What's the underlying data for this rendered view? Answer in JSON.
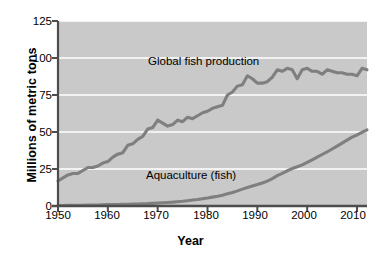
{
  "chart_data": {
    "type": "line",
    "title": "",
    "subtitle": "",
    "xlabel": "Year",
    "ylabel": "Millions of metric tons",
    "xlim": [
      1950,
      2012
    ],
    "ylim": [
      0,
      125
    ],
    "ytick_labels": [
      "0",
      "25",
      "50",
      "75",
      "100",
      "125"
    ],
    "yticks": [
      0,
      25,
      50,
      75,
      100,
      125
    ],
    "xtick_labels": [
      "1950",
      "1960",
      "1970",
      "1980",
      "1990",
      "2000",
      "2010"
    ],
    "xticks": [
      1950,
      1960,
      1970,
      1980,
      1990,
      2000,
      2010
    ],
    "grid": "horizontal-white",
    "legend_position": "inline-annotations",
    "plot_background": "#c9c9c9",
    "line_color": "#7f7f7f",
    "gridline_color": "#ffffff",
    "axis_color": "#4d4d4d",
    "annotations": [
      {
        "text": "Global fish production",
        "x": 1976,
        "y": 101
      },
      {
        "text": "Aquaculture (fish)",
        "x": 1976,
        "y": 24
      }
    ],
    "x": [
      1950,
      1951,
      1952,
      1953,
      1954,
      1955,
      1956,
      1957,
      1958,
      1959,
      1960,
      1961,
      1962,
      1963,
      1964,
      1965,
      1966,
      1967,
      1968,
      1969,
      1970,
      1971,
      1972,
      1973,
      1974,
      1975,
      1976,
      1977,
      1978,
      1979,
      1980,
      1981,
      1982,
      1983,
      1984,
      1985,
      1986,
      1987,
      1988,
      1989,
      1990,
      1991,
      1992,
      1993,
      1994,
      1995,
      1996,
      1997,
      1998,
      1999,
      2000,
      2001,
      2002,
      2003,
      2004,
      2005,
      2006,
      2007,
      2008,
      2009,
      2010,
      2011,
      2012
    ],
    "series": [
      {
        "name": "Global fish production",
        "values": [
          17,
          19,
          21,
          22,
          22,
          24,
          26,
          26,
          27,
          29,
          30,
          33,
          35,
          36,
          41,
          42,
          45,
          47,
          52,
          53,
          58,
          56,
          54,
          55,
          58,
          57,
          60,
          59,
          61,
          63,
          64,
          66,
          67,
          68,
          75,
          77,
          81,
          82,
          88,
          86,
          83,
          83,
          84,
          87,
          92,
          91,
          93,
          92,
          86,
          92,
          93,
          91,
          91,
          89,
          92,
          91,
          90,
          90,
          89,
          89,
          88,
          93,
          92
        ]
      },
      {
        "name": "Aquaculture (fish)",
        "values": [
          0.3,
          0.3,
          0.4,
          0.4,
          0.5,
          0.5,
          0.6,
          0.6,
          0.7,
          0.8,
          0.9,
          0.9,
          1.0,
          1.1,
          1.2,
          1.3,
          1.4,
          1.5,
          1.6,
          1.8,
          2.0,
          2.2,
          2.4,
          2.6,
          2.9,
          3.2,
          3.6,
          4.0,
          4.4,
          4.9,
          5.4,
          6.0,
          6.6,
          7.3,
          8.2,
          9.1,
          10.2,
          11.4,
          12.5,
          13.5,
          14.5,
          15.5,
          16.8,
          18.5,
          20.5,
          22.0,
          23.8,
          25.3,
          26.5,
          27.8,
          29.5,
          31.2,
          33.0,
          34.8,
          36.5,
          38.5,
          40.5,
          42.5,
          44.5,
          46.5,
          48.0,
          49.8,
          51.5
        ]
      }
    ]
  },
  "axes": {
    "ylabel": "Millions of metric tons",
    "xlabel": "Year"
  }
}
